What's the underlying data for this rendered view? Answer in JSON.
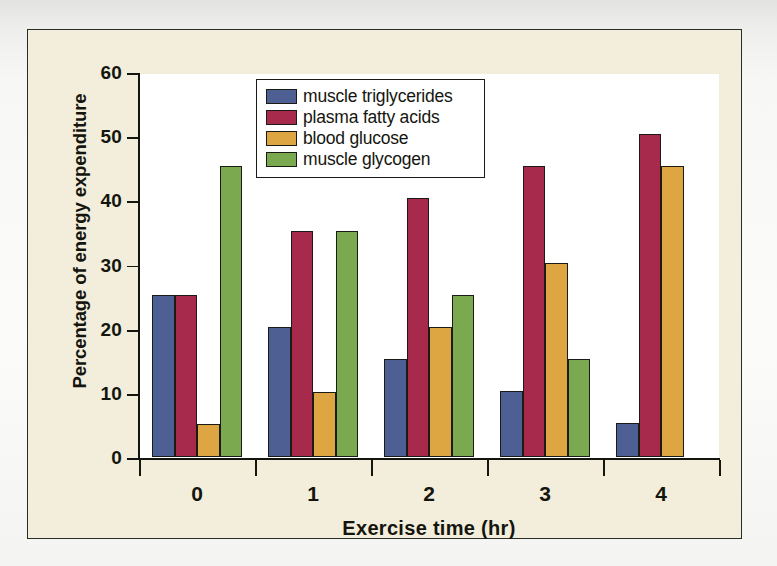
{
  "figure": {
    "panel_background": "#f3eedb",
    "plot_background": "#ffffff",
    "border_color": "#2b2b28"
  },
  "chart_data": {
    "type": "bar",
    "title": "",
    "subtitle": "",
    "xlabel": "Exercise time (hr)",
    "ylabel": "Percentage of energy expenditure",
    "categories": [
      "0",
      "1",
      "2",
      "3",
      "4"
    ],
    "yticks": [
      0,
      10,
      20,
      30,
      40,
      50,
      60
    ],
    "ylim": [
      0,
      60
    ],
    "grid": false,
    "legend_position": "top-center",
    "series": [
      {
        "name": "muscle triglycerides",
        "color": "#4e5f93",
        "values": [
          25.2,
          20.3,
          15.2,
          10.3,
          5.3
        ]
      },
      {
        "name": "plasma fatty acids",
        "color": "#a72a4c",
        "values": [
          25.2,
          35.2,
          40.4,
          45.4,
          50.4
        ]
      },
      {
        "name": "blood glucose",
        "color": "#dda643",
        "values": [
          5.1,
          10.2,
          20.3,
          30.3,
          45.4
        ]
      },
      {
        "name": "muscle glycogen",
        "color": "#7aa94f",
        "values": [
          45.3,
          35.3,
          25.3,
          15.2,
          0
        ]
      }
    ]
  }
}
